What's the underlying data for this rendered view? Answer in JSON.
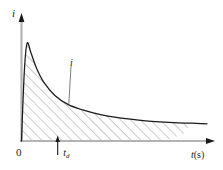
{
  "figure": {
    "background_color": "#ffffff",
    "axis_color": "#b4b4b4",
    "curve_color": "#1a1a1a",
    "hatch_color": "#8c8c8c",
    "arrow_color": "#1a1a1a"
  },
  "labels": {
    "y_axis": "i",
    "x_axis_var": "t",
    "x_axis_unit": "(s)",
    "origin": "0",
    "marker_var": "t",
    "marker_sub": "d",
    "curve": "i"
  },
  "chart_data": {
    "type": "line",
    "title": "",
    "xlabel": "t(s)",
    "ylabel": "i",
    "xlim": [
      0,
      1
    ],
    "ylim": [
      0,
      1
    ],
    "grid": false,
    "legend": "none",
    "series": [
      {
        "name": "i",
        "description": "Sharp rise from origin to peak then monotonic decay toward asymptote",
        "x": [
          0.0,
          0.015,
          0.03,
          0.05,
          0.08,
          0.12,
          0.18,
          0.25,
          0.33,
          0.42,
          0.52,
          0.62,
          0.72,
          0.82,
          0.92,
          1.0
        ],
        "y": [
          0.0,
          0.62,
          0.88,
          0.8,
          0.66,
          0.53,
          0.41,
          0.33,
          0.28,
          0.24,
          0.21,
          0.19,
          0.175,
          0.165,
          0.16,
          0.155
        ]
      }
    ],
    "fill_under_curve": {
      "enabled": true,
      "style": "diagonal-hatch",
      "angle_deg": 45,
      "spacing_px": 7,
      "x_range": [
        0.0,
        0.78
      ]
    },
    "annotations": [
      {
        "name": "marker-td",
        "type": "up-arrow-tick",
        "x": 0.195,
        "y": 0,
        "label": "t_d"
      },
      {
        "name": "curve-callout",
        "type": "leader-line",
        "label": "i",
        "anchor_x": 0.255,
        "anchor_y": 0.33
      }
    ]
  }
}
